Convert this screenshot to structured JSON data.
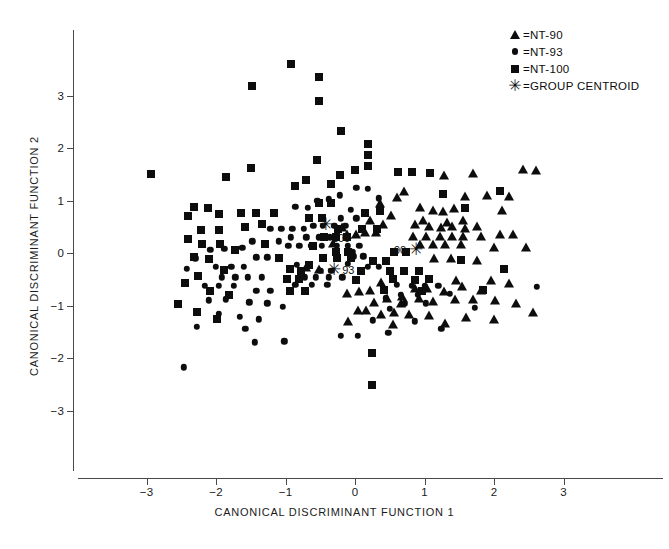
{
  "chart_data": {
    "type": "scatter",
    "title": "",
    "xlabel": "CANONICAL DISCRIMINANT FUNCTION 1",
    "ylabel": "CANONICAL DISCRIMINANT FUNCTION 2",
    "xlim": [
      -3.95,
      3.55
    ],
    "ylim": [
      -3.75,
      4.15
    ],
    "xticks": [
      -3,
      -2,
      -1,
      0,
      1,
      2,
      3
    ],
    "xticklabels": [
      "−3",
      "−2",
      "−1",
      "0",
      "1",
      "2",
      "3"
    ],
    "yticks": [
      -3,
      -2,
      -1,
      0,
      1,
      2,
      3
    ],
    "yticklabels": [
      "−3",
      "−2",
      "−1",
      "0",
      "1",
      "2",
      "3"
    ],
    "grid": false,
    "legend_position": "top-right",
    "legend": [
      {
        "marker": "triangle",
        "symbol": "▲",
        "label": "=NT-90"
      },
      {
        "marker": "circle",
        "symbol": "●",
        "label": "=NT-93"
      },
      {
        "marker": "square",
        "symbol": "■",
        "label": "=NT-100"
      },
      {
        "marker": "star",
        "symbol": "✳",
        "label": "=GROUP CENTROID"
      }
    ],
    "series": [
      {
        "name": "NT-90",
        "marker": "triangle",
        "points": [
          [
            0.7,
            1.19
          ],
          [
            1.28,
            1.48
          ],
          [
            1.7,
            1.52
          ],
          [
            2.42,
            1.6
          ],
          [
            1.58,
            1.08
          ],
          [
            1.9,
            1.1
          ],
          [
            2.22,
            1.08
          ],
          [
            2.6,
            1.58
          ],
          [
            0.94,
            0.88
          ],
          [
            1.26,
            0.8
          ],
          [
            1.42,
            0.86
          ],
          [
            1.12,
            0.82
          ],
          [
            0.98,
            0.62
          ],
          [
            1.32,
            0.6
          ],
          [
            1.56,
            0.62
          ],
          [
            2.12,
            0.82
          ],
          [
            0.86,
            0.56
          ],
          [
            1.06,
            0.52
          ],
          [
            1.24,
            0.5
          ],
          [
            1.4,
            0.52
          ],
          [
            1.58,
            0.47
          ],
          [
            1.76,
            0.52
          ],
          [
            0.84,
            0.33
          ],
          [
            1.02,
            0.33
          ],
          [
            1.22,
            0.33
          ],
          [
            1.4,
            0.33
          ],
          [
            1.56,
            0.33
          ],
          [
            1.82,
            0.33
          ],
          [
            2.08,
            0.36
          ],
          [
            2.28,
            0.36
          ],
          [
            0.94,
            0.18
          ],
          [
            1.12,
            0.18
          ],
          [
            1.3,
            0.18
          ],
          [
            1.52,
            0.17
          ],
          [
            2.0,
            0.12
          ],
          [
            2.46,
            0.12
          ],
          [
            1.14,
            -0.1
          ],
          [
            1.38,
            -0.1
          ],
          [
            1.76,
            -0.14
          ],
          [
            0.36,
            0.95
          ],
          [
            0.52,
            0.72
          ],
          [
            0.22,
            0.62
          ],
          [
            0.4,
            0.55
          ],
          [
            0.14,
            0.4
          ],
          [
            0.3,
            0.4
          ],
          [
            0.02,
            0.36
          ],
          [
            -0.18,
            0.5
          ],
          [
            -0.12,
            0.36
          ],
          [
            -0.32,
            0.2
          ],
          [
            -0.52,
            -0.3
          ],
          [
            -0.7,
            -0.26
          ],
          [
            1.96,
            -0.52
          ],
          [
            1.54,
            -0.62
          ],
          [
            1.82,
            -0.7
          ],
          [
            2.22,
            -0.58
          ],
          [
            0.86,
            -0.66
          ],
          [
            1.04,
            -0.66
          ],
          [
            1.28,
            -0.72
          ],
          [
            0.68,
            -0.82
          ],
          [
            0.92,
            -0.86
          ],
          [
            1.12,
            -0.92
          ],
          [
            1.44,
            -0.88
          ],
          [
            1.7,
            -0.88
          ],
          [
            2.02,
            -0.9
          ],
          [
            2.32,
            -0.96
          ],
          [
            2.56,
            -1.12
          ],
          [
            0.38,
            -0.56
          ],
          [
            0.22,
            -0.7
          ],
          [
            0.06,
            -0.72
          ],
          [
            -0.12,
            -0.76
          ],
          [
            0.46,
            -0.86
          ],
          [
            0.28,
            -0.94
          ],
          [
            0.16,
            -1.08
          ],
          [
            0.38,
            -1.16
          ],
          [
            0.56,
            -1.12
          ],
          [
            0.78,
            -1.16
          ],
          [
            1.06,
            -1.18
          ],
          [
            -0.1,
            -1.3
          ],
          [
            0.54,
            -1.36
          ],
          [
            1.3,
            -1.34
          ],
          [
            1.6,
            -1.22
          ],
          [
            2.0,
            -1.26
          ],
          [
            0.04,
            -1.08
          ],
          [
            0.66,
            -0.96
          ],
          [
            1.46,
            -0.52
          ],
          [
            0.6,
            1.06
          ]
        ]
      },
      {
        "name": "NT-93",
        "marker": "circle",
        "points": [
          [
            -1.22,
            0.46
          ],
          [
            -1.06,
            0.46
          ],
          [
            -0.9,
            0.46
          ],
          [
            -0.74,
            0.46
          ],
          [
            -0.6,
            0.52
          ],
          [
            -0.46,
            0.52
          ],
          [
            -0.3,
            0.52
          ],
          [
            -0.14,
            0.52
          ],
          [
            -0.92,
            0.3
          ],
          [
            -0.7,
            0.3
          ],
          [
            -0.52,
            0.3
          ],
          [
            -0.36,
            0.3
          ],
          [
            -1.1,
            0.22
          ],
          [
            -0.96,
            0.14
          ],
          [
            -0.8,
            0.14
          ],
          [
            -0.64,
            0.14
          ],
          [
            -0.48,
            0.14
          ],
          [
            -0.26,
            0.14
          ],
          [
            -0.1,
            0.14
          ],
          [
            0.06,
            0.14
          ],
          [
            -0.2,
            0.66
          ],
          [
            0.02,
            0.66
          ],
          [
            -0.06,
            0.82
          ],
          [
            -1.48,
            0.22
          ],
          [
            -1.62,
            0.1
          ],
          [
            -1.88,
            0.08
          ],
          [
            -2.08,
            0.06
          ],
          [
            -1.42,
            -0.08
          ],
          [
            -1.26,
            -0.08
          ],
          [
            -1.6,
            -0.26
          ],
          [
            -1.78,
            -0.26
          ],
          [
            -2.0,
            -0.26
          ],
          [
            -1.92,
            -0.46
          ],
          [
            -1.72,
            -0.46
          ],
          [
            -1.54,
            -0.46
          ],
          [
            -1.34,
            -0.46
          ],
          [
            -2.16,
            -0.62
          ],
          [
            -1.96,
            -0.62
          ],
          [
            -1.74,
            -0.62
          ],
          [
            -1.42,
            -0.72
          ],
          [
            -1.22,
            -0.72
          ],
          [
            -2.1,
            -0.9
          ],
          [
            -1.86,
            -0.88
          ],
          [
            -1.52,
            -0.94
          ],
          [
            -1.26,
            -0.96
          ],
          [
            -1.04,
            -1.02
          ],
          [
            -1.96,
            -1.16
          ],
          [
            -1.66,
            -1.22
          ],
          [
            -1.38,
            -1.26
          ],
          [
            -2.28,
            -1.4
          ],
          [
            -1.58,
            -1.44
          ],
          [
            -0.84,
            -0.22
          ],
          [
            -0.66,
            -0.22
          ],
          [
            -0.5,
            -0.34
          ],
          [
            -0.34,
            -0.34
          ],
          [
            -0.72,
            -0.46
          ],
          [
            -0.56,
            -0.46
          ],
          [
            -0.38,
            -0.46
          ],
          [
            -0.18,
            -0.46
          ],
          [
            -0.86,
            -0.6
          ],
          [
            -0.62,
            -0.6
          ],
          [
            -0.4,
            -0.6
          ],
          [
            -0.02,
            -0.06
          ],
          [
            0.12,
            -0.06
          ],
          [
            -0.1,
            -0.2
          ],
          [
            0.18,
            -0.26
          ],
          [
            0.34,
            -0.26
          ],
          [
            -0.04,
            0.02
          ],
          [
            0.6,
            -0.6
          ],
          [
            0.82,
            -0.62
          ],
          [
            1.0,
            -0.62
          ],
          [
            1.2,
            -0.62
          ],
          [
            0.66,
            -0.8
          ],
          [
            0.9,
            -0.8
          ],
          [
            1.36,
            -0.78
          ],
          [
            0.44,
            -0.86
          ],
          [
            0.72,
            -0.96
          ],
          [
            1.02,
            -0.96
          ],
          [
            0.5,
            -1.06
          ],
          [
            1.72,
            -1.04
          ],
          [
            0.26,
            -1.28
          ],
          [
            0.86,
            -1.3
          ],
          [
            1.24,
            -1.44
          ],
          [
            -0.2,
            -1.58
          ],
          [
            0.04,
            -1.58
          ],
          [
            0.48,
            -1.52
          ],
          [
            -1.02,
            -1.68
          ],
          [
            -1.44,
            -1.7
          ],
          [
            -2.46,
            -2.18
          ],
          [
            -2.3,
            -0.1
          ],
          [
            -2.42,
            -0.3
          ],
          [
            2.62,
            -0.64
          ],
          [
            0.02,
            1.24
          ],
          [
            0.18,
            1.22
          ],
          [
            -0.22,
            1.1
          ],
          [
            -0.38,
            1.02
          ],
          [
            -0.54,
            1.0
          ],
          [
            0.34,
            1.04
          ],
          [
            -0.68,
            0.86
          ],
          [
            -0.86,
            0.88
          ]
        ]
      },
      {
        "name": "NT-100",
        "marker": "square",
        "points": [
          [
            -0.92,
            3.6
          ],
          [
            -0.52,
            3.36
          ],
          [
            -1.48,
            3.18
          ],
          [
            -0.52,
            2.9
          ],
          [
            -0.2,
            2.32
          ],
          [
            0.18,
            2.08
          ],
          [
            0.18,
            1.86
          ],
          [
            0.18,
            1.66
          ],
          [
            0.62,
            1.54
          ],
          [
            0.82,
            1.54
          ],
          [
            -1.5,
            1.62
          ],
          [
            -1.86,
            1.44
          ],
          [
            -0.54,
            1.78
          ],
          [
            -0.7,
            1.4
          ],
          [
            -0.22,
            1.48
          ],
          [
            0.0,
            1.58
          ],
          [
            -2.94,
            1.5
          ],
          [
            1.08,
            1.52
          ],
          [
            1.26,
            1.12
          ],
          [
            2.08,
            1.18
          ],
          [
            -0.86,
            1.28
          ],
          [
            -0.34,
            1.32
          ],
          [
            -0.52,
            0.96
          ],
          [
            -0.34,
            0.96
          ],
          [
            -1.16,
            0.76
          ],
          [
            -1.42,
            0.76
          ],
          [
            -1.64,
            0.76
          ],
          [
            -1.96,
            0.74
          ],
          [
            -2.12,
            0.86
          ],
          [
            -2.32,
            0.88
          ],
          [
            -2.4,
            0.7
          ],
          [
            -1.34,
            0.56
          ],
          [
            -1.58,
            0.5
          ],
          [
            -1.96,
            0.44
          ],
          [
            -2.22,
            0.44
          ],
          [
            -2.4,
            0.26
          ],
          [
            -2.2,
            0.18
          ],
          [
            -1.94,
            0.18
          ],
          [
            -1.72,
            0.06
          ],
          [
            -2.32,
            -0.08
          ],
          [
            -2.1,
            -0.12
          ],
          [
            -1.88,
            -0.32
          ],
          [
            -2.26,
            -0.44
          ],
          [
            -2.44,
            -0.58
          ],
          [
            -2.08,
            -0.72
          ],
          [
            -1.82,
            -0.8
          ],
          [
            -2.54,
            -0.98
          ],
          [
            -2.28,
            -1.12
          ],
          [
            -1.98,
            -1.26
          ],
          [
            -0.66,
            0.66
          ],
          [
            -0.48,
            0.66
          ],
          [
            -0.44,
            0.3
          ],
          [
            -0.28,
            0.3
          ],
          [
            -0.12,
            0.3
          ],
          [
            -0.6,
            0.14
          ],
          [
            -0.28,
            0.02
          ],
          [
            -0.1,
            0.02
          ],
          [
            -0.46,
            -0.1
          ],
          [
            -0.26,
            -0.1
          ],
          [
            -0.06,
            -0.1
          ],
          [
            -0.66,
            -0.22
          ],
          [
            -0.94,
            -0.3
          ],
          [
            -0.78,
            -0.34
          ],
          [
            -0.98,
            -0.5
          ],
          [
            -0.8,
            -0.5
          ],
          [
            -0.94,
            -0.72
          ],
          [
            -0.72,
            -0.72
          ],
          [
            -0.24,
            0.46
          ],
          [
            0.1,
            0.46
          ],
          [
            0.32,
            0.46
          ],
          [
            0.14,
            0.76
          ],
          [
            0.36,
            0.8
          ],
          [
            0.56,
            0.02
          ],
          [
            0.74,
            0.02
          ],
          [
            0.5,
            -0.34
          ],
          [
            0.7,
            -0.34
          ],
          [
            0.92,
            -0.34
          ],
          [
            0.54,
            -0.5
          ],
          [
            0.86,
            -0.52
          ],
          [
            1.06,
            -0.5
          ],
          [
            0.42,
            -0.7
          ],
          [
            0.96,
            -0.72
          ],
          [
            1.58,
            0.86
          ],
          [
            1.52,
            -0.14
          ],
          [
            0.26,
            -0.16
          ],
          [
            0.44,
            -0.16
          ],
          [
            0.08,
            -0.34
          ],
          [
            0.02,
            -0.52
          ],
          [
            0.24,
            -1.9
          ],
          [
            0.24,
            -2.52
          ],
          [
            1.84,
            -0.7
          ],
          [
            2.14,
            -0.3
          ],
          [
            -1.1,
            -0.1
          ],
          [
            -1.3,
            0.18
          ]
        ]
      }
    ],
    "centroids": [
      {
        "label": "100",
        "x": -0.42,
        "y": 0.56,
        "label_side": "right",
        "label_dx": 6,
        "label_dy": 14
      },
      {
        "label": "93",
        "x": -0.3,
        "y": -0.3,
        "label_side": "right",
        "label_dx": 8,
        "label_dy": 1
      },
      {
        "label": "90",
        "x": 0.88,
        "y": 0.08,
        "label_side": "left",
        "label_dx": -10,
        "label_dy": 1
      }
    ]
  }
}
